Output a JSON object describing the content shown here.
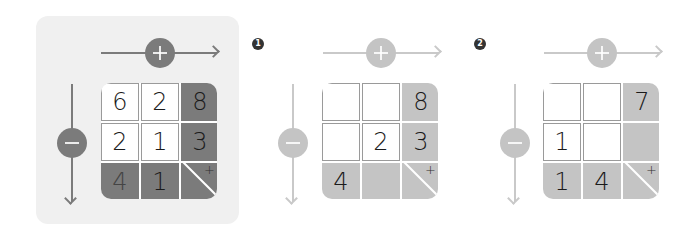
{
  "colors": {
    "panel_bg": "#f0f0f0",
    "dark_fill": "#7b7b7b",
    "dark_arrow": "#7b7b7b",
    "light_fill": "#c4c4c4",
    "light_arrow": "#c9c9c9"
  },
  "panels": [
    {
      "badge": "",
      "row_op": "+",
      "col_op": "−",
      "cells": [
        [
          "6",
          "2",
          "8"
        ],
        [
          "2",
          "1",
          "3"
        ],
        [
          "4",
          "1",
          ""
        ]
      ],
      "corner": {
        "plus": "+",
        "minus": "_"
      }
    },
    {
      "badge": "1",
      "row_op": "+",
      "col_op": "−",
      "cells": [
        [
          "",
          "",
          "8"
        ],
        [
          "",
          "2",
          "3"
        ],
        [
          "4",
          "",
          ""
        ]
      ],
      "corner": {
        "plus": "+",
        "minus": "_"
      }
    },
    {
      "badge": "2",
      "row_op": "+",
      "col_op": "−",
      "cells": [
        [
          "",
          "",
          "7"
        ],
        [
          "1",
          "",
          ""
        ],
        [
          "1",
          "4",
          ""
        ]
      ],
      "corner": {
        "plus": "+",
        "minus": "_"
      }
    }
  ]
}
